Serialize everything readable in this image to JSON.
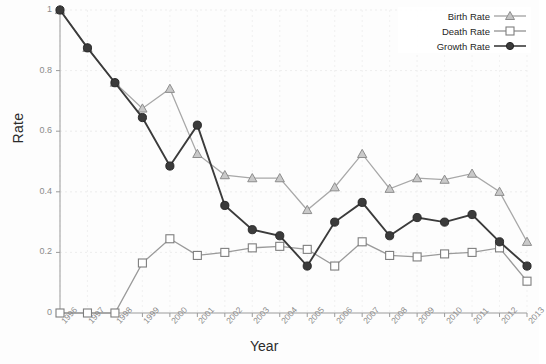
{
  "chart_data": {
    "type": "line",
    "title": "",
    "xlabel": "Year",
    "ylabel": "Rate",
    "grid": true,
    "legend_position": "top-right",
    "xlim": [
      1996,
      2013
    ],
    "ylim": [
      0,
      1
    ],
    "ytick_labels": [
      "0",
      "0.2",
      "0.4",
      "0.6",
      "0.8",
      "1"
    ],
    "ytick_values": [
      0,
      0.2,
      0.4,
      0.6,
      0.8,
      1
    ],
    "categories": [
      1996,
      1997,
      1998,
      1999,
      2000,
      2001,
      2002,
      2003,
      2004,
      2005,
      2006,
      2007,
      2008,
      2009,
      2010,
      2011,
      2012,
      2013
    ],
    "xtick_labels": [
      "1996",
      "1997",
      "1998",
      "1999",
      "2000",
      "2001",
      "2002",
      "2003",
      "2004",
      "2005",
      "2006",
      "2007",
      "2008",
      "2009",
      "2010",
      "2011",
      "2012",
      "2013"
    ],
    "series": [
      {
        "name": "Birth Rate",
        "marker": "triangle",
        "color": "#a8a8a8",
        "values": [
          1.0,
          0.875,
          0.76,
          0.675,
          0.74,
          0.525,
          0.455,
          0.445,
          0.445,
          0.34,
          0.415,
          0.525,
          0.41,
          0.445,
          0.44,
          0.46,
          0.4,
          0.235
        ]
      },
      {
        "name": "Death Rate",
        "marker": "square",
        "color": "#9a9a9a",
        "values": [
          0.0,
          0.0,
          0.0,
          0.165,
          0.245,
          0.19,
          0.2,
          0.215,
          0.22,
          0.21,
          0.155,
          0.235,
          0.19,
          0.185,
          0.195,
          0.2,
          0.215,
          0.105
        ]
      },
      {
        "name": "Growth Rate",
        "marker": "circle",
        "color": "#3b3b3b",
        "values": [
          1.0,
          0.875,
          0.76,
          0.645,
          0.485,
          0.62,
          0.355,
          0.275,
          0.255,
          0.155,
          0.3,
          0.365,
          0.255,
          0.315,
          0.3,
          0.325,
          0.235,
          0.155
        ]
      }
    ]
  },
  "axis": {
    "y_title": "Rate",
    "x_title": "Year"
  },
  "legend": {
    "items": [
      {
        "label": "Birth Rate"
      },
      {
        "label": "Death Rate"
      },
      {
        "label": "Growth Rate"
      }
    ]
  }
}
